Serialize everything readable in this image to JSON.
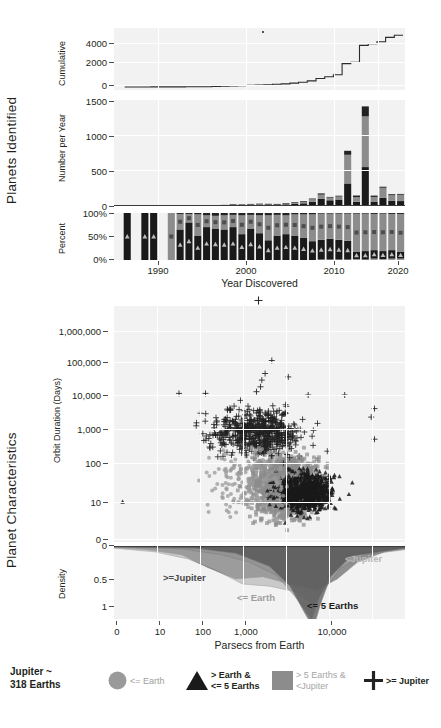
{
  "sections": {
    "top_title": "Planets  Identified",
    "bottom_title": "Planet Characteristics"
  },
  "colors": {
    "le_earth": "#9a9a9a",
    "gt_earth_le5": "#1a1a1a",
    "gt5_lt_jupiter": "#8c8c8c",
    "ge_jupiter": "#222222",
    "panel_bg": "#f2f2f2",
    "grid": "#ffffff",
    "text": "#231f20",
    "light_text": "#a6a6a6"
  },
  "chart_data": [
    {
      "type": "line",
      "name": "cumulative-discoveries",
      "title": "",
      "ylabel": "Cumulative",
      "xlabel": "Year Discovered",
      "yticks": [
        "4000",
        "2000",
        "0"
      ],
      "ytickvals": [
        4000,
        2000,
        0
      ],
      "ylim": [
        0,
        4400
      ],
      "xlim": [
        1988,
        2021
      ],
      "x": [
        1989,
        1990,
        1991,
        1992,
        1993,
        1994,
        1995,
        1996,
        1997,
        1998,
        1999,
        2000,
        2001,
        2002,
        2003,
        2004,
        2005,
        2006,
        2007,
        2008,
        2009,
        2010,
        2011,
        2012,
        2013,
        2014,
        2015,
        2016,
        2017,
        2018,
        2019,
        2020
      ],
      "values": [
        1,
        1,
        2,
        5,
        5,
        5,
        6,
        12,
        16,
        25,
        40,
        55,
        77,
        97,
        122,
        154,
        184,
        213,
        247,
        306,
        367,
        477,
        666,
        800,
        955,
        1840,
        1950,
        3270,
        3400,
        3550,
        3900,
        4060
      ]
    },
    {
      "type": "bar",
      "name": "discoveries-per-year-stacked",
      "stacked": true,
      "ylabel": "Number per Year",
      "xlabel": "Year Discovered",
      "yticks": [
        "1500",
        "1000",
        "500",
        "0"
      ],
      "ytickvals": [
        1500,
        1000,
        500,
        0
      ],
      "ylim": [
        0,
        1560
      ],
      "categories": [
        1989,
        1990,
        1991,
        1992,
        1993,
        1994,
        1995,
        1996,
        1997,
        1998,
        1999,
        2000,
        2001,
        2002,
        2003,
        2004,
        2005,
        2006,
        2007,
        2008,
        2009,
        2010,
        2011,
        2012,
        2013,
        2014,
        2015,
        2016,
        2017,
        2018,
        2019,
        2020
      ],
      "series": [
        {
          "name": "<= Earth",
          "values": [
            0,
            0,
            0,
            0,
            0,
            0,
            0,
            0,
            0,
            0,
            0,
            0,
            0,
            0,
            0,
            0,
            0,
            0,
            0,
            0,
            0,
            0,
            1,
            1,
            2,
            8,
            2,
            14,
            4,
            4,
            5,
            4
          ]
        },
        {
          "name": "> Earth & <= 5 Earths",
          "values": [
            1,
            0,
            1,
            3,
            0,
            0,
            1,
            2,
            2,
            5,
            8,
            8,
            14,
            12,
            16,
            20,
            22,
            20,
            25,
            32,
            40,
            62,
            110,
            85,
            95,
            330,
            60,
            570,
            62,
            120,
            72,
            70
          ]
        },
        {
          "name": "> 5 Earths & <Jupiter",
          "values": [
            0,
            0,
            0,
            0,
            0,
            0,
            0,
            1,
            1,
            2,
            3,
            4,
            5,
            5,
            7,
            8,
            6,
            7,
            9,
            15,
            22,
            40,
            60,
            40,
            45,
            430,
            70,
            760,
            70,
            150,
            85,
            95
          ]
        },
        {
          "name": ">= Jupiter",
          "values": [
            0,
            0,
            0,
            0,
            0,
            0,
            0,
            3,
            2,
            2,
            4,
            5,
            7,
            6,
            8,
            7,
            5,
            4,
            6,
            10,
            11,
            10,
            18,
            10,
            12,
            60,
            25,
            150,
            20,
            15,
            15,
            12
          ]
        }
      ]
    },
    {
      "type": "bar",
      "name": "discoveries-percent-stacked",
      "stacked": true,
      "normalized": true,
      "ylabel": "Percent",
      "xlabel": "Year Discovered",
      "yticks": [
        "100%",
        "50%",
        "0%"
      ],
      "ytickvals": [
        100,
        50,
        0
      ],
      "ylim": [
        0,
        100
      ],
      "categories": [
        1989,
        1990,
        1991,
        1992,
        1993,
        1994,
        1995,
        1996,
        1997,
        1998,
        1999,
        2000,
        2001,
        2002,
        2003,
        2004,
        2005,
        2006,
        2007,
        2008,
        2009,
        2010,
        2011,
        2012,
        2013,
        2014,
        2015,
        2016,
        2017,
        2018,
        2019,
        2020
      ],
      "series": [
        {
          "name": "<= Earth",
          "values": [
            0,
            0,
            0,
            0,
            0,
            0,
            0,
            0,
            0,
            0,
            0,
            0,
            0,
            0,
            0,
            0,
            0,
            0,
            0,
            0,
            0,
            0,
            1,
            1,
            1,
            1,
            2,
            1,
            3,
            2,
            3,
            3
          ]
        },
        {
          "name": "> Earth & <= 5 Earths",
          "values": [
            100,
            0,
            100,
            100,
            0,
            0,
            65,
            80,
            52,
            70,
            67,
            65,
            70,
            55,
            67,
            57,
            42,
            52,
            55,
            52,
            47,
            40,
            42,
            44,
            42,
            40,
            16,
            18,
            18,
            17,
            18,
            15
          ]
        },
        {
          "name": "> 5 Earths & <Jupiter",
          "values": [
            0,
            0,
            0,
            0,
            0,
            100,
            33,
            18,
            45,
            25,
            27,
            30,
            26,
            40,
            29,
            38,
            53,
            44,
            40,
            45,
            50,
            57,
            56,
            54,
            56,
            58,
            81,
            80,
            77,
            80,
            77,
            80
          ]
        },
        {
          "name": ">= Jupiter",
          "values": [
            0,
            0,
            0,
            0,
            0,
            0,
            2,
            2,
            3,
            5,
            6,
            5,
            4,
            5,
            4,
            5,
            5,
            4,
            5,
            3,
            3,
            3,
            1,
            1,
            1,
            1,
            1,
            1,
            2,
            1,
            2,
            2
          ]
        }
      ],
      "xticks": [
        "1990",
        "2000",
        "2010",
        "2020"
      ],
      "xtickvals": [
        1990,
        2000,
        2010,
        2020
      ]
    },
    {
      "type": "scatter",
      "name": "orbit-duration-vs-distance",
      "xlabel": "Parsecs from Earth",
      "ylabel": "Orbit Duration (Days)",
      "yticks": [
        "1,000,000",
        "100,000",
        "10,000",
        "1,000",
        "100",
        "10",
        "0"
      ],
      "ytickvals": [
        1000000,
        100000,
        10000,
        1000,
        100,
        10,
        0
      ],
      "xlim_log": [
        1,
        10000
      ],
      "xticks": [
        "0",
        "10",
        "100",
        "1,000",
        "10,000"
      ],
      "series": [
        {
          "name": "<= Earth",
          "marker": "circle",
          "color": "#9a9a9a",
          "count": 160
        },
        {
          "name": "> Earth & <= 5 Earths",
          "marker": "triangle",
          "color": "#1a1a1a",
          "count": 900
        },
        {
          "name": "> 5 Earths & <Jupiter",
          "marker": "square",
          "color": "#8c8c8c",
          "count": 1500
        },
        {
          "name": ">= Jupiter",
          "marker": "plus",
          "color": "#222222",
          "count": 700
        }
      ]
    },
    {
      "type": "area",
      "name": "distance-density",
      "ylabel": "Density",
      "xlabel": "Parsecs from Earth",
      "yticks": [
        "0",
        "0.5",
        "1"
      ],
      "ytickvals": [
        0,
        0.5,
        1
      ],
      "xticks": [
        "0",
        "10",
        "100",
        "1,000",
        "10,000"
      ],
      "xtickvals": [
        1,
        10,
        100,
        1000,
        10000
      ],
      "annotations": [
        {
          "text": ">=Jupiter",
          "color": "#4a4a4a"
        },
        {
          "text": "<Jupiter",
          "color": "#b3b3b3"
        },
        {
          "text": "<= Earth",
          "color": "#9a9a9a"
        },
        {
          "text": "<= 5 Earths",
          "color": "#1a1a1a"
        }
      ]
    }
  ],
  "legend": {
    "note_line1": "Jupiter ~",
    "note_line2": "318 Earths",
    "items": [
      {
        "marker": "circle",
        "label_line1": "<= Earth",
        "label_line2": "",
        "color": "#9a9a9a",
        "text_color": "#9a9a9a",
        "bold": false
      },
      {
        "marker": "triangle",
        "label_line1": "> Earth &",
        "label_line2": "<= 5 Earths",
        "color": "#1a1a1a",
        "text_color": "#231f20",
        "bold": true
      },
      {
        "marker": "square",
        "label_line1": "> 5 Earths &",
        "label_line2": "<Jupiter",
        "color": "#8c8c8c",
        "text_color": "#a6a6a6",
        "bold": false
      },
      {
        "marker": "plus",
        "label_line1": ">= Jupiter",
        "label_line2": "",
        "color": "#222222",
        "text_color": "#231f20",
        "bold": true
      }
    ]
  }
}
